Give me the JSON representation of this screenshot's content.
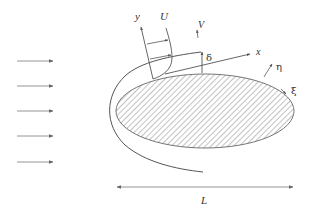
{
  "diagram": {
    "colors": {
      "line": "#555555",
      "arrow": "#777777",
      "hatch": "#666666",
      "text": "#333333",
      "background": "#ffffff"
    },
    "freestream_arrows": {
      "count": 5,
      "direction": "right"
    },
    "labels": {
      "y_axis": "y",
      "x_axis": "x",
      "velocity_U": "U",
      "velocity_V": "V",
      "thickness": "δ",
      "normal_coord": "η",
      "tangent_coord": "ξ",
      "length": "L"
    },
    "body": {
      "shape": "ellipse",
      "fill": "hatched"
    }
  }
}
